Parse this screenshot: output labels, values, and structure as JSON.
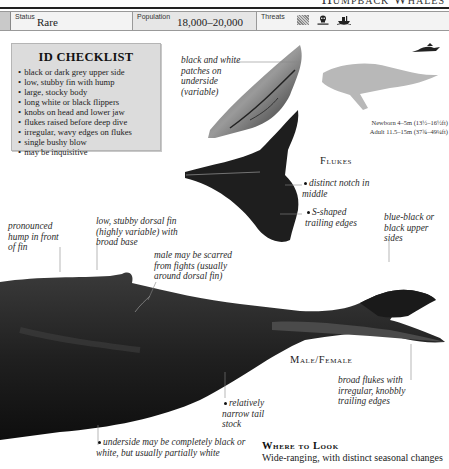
{
  "page_header": {
    "title": "Humpback Whales"
  },
  "facts": {
    "status_label": "Status",
    "status_value": "Rare",
    "population_label": "Population",
    "population_value": "18,000–20,000",
    "threats_label": "Threats",
    "threat_icons": [
      "net-icon",
      "pollution-skull-icon",
      "whaling-ship-icon"
    ]
  },
  "checklist": {
    "title": "ID CHECKLIST",
    "items": [
      "black or dark grey upper side",
      "low, stubby fin with hump",
      "large, stocky body",
      "long white or black flippers",
      "knobs on head and lower jaw",
      "flukes raised before deep dive",
      "irregular, wavy edges on flukes",
      "single bushy blow",
      "may be inquisitive"
    ]
  },
  "flukes_section": {
    "caption": "Flukes",
    "notes": {
      "underside": "black and white patches on underside (variable)",
      "notch": "distinct notch in middle",
      "trailing": "S-shaped trailing edges"
    }
  },
  "size": {
    "newborn": "Newborn 4–5m (13½–16½ft)",
    "adult": "Adult 11.5–15m (37¾–49¼ft)"
  },
  "body_notes": {
    "hump": "pronounced hump in front of fin",
    "dorsal": "low, stubby dorsal fin (highly variable) with broad base",
    "scars": "male may be scarred from fights (usually around dorsal fin)",
    "upper": "blue-black or black upper sides",
    "tail_stock": "relatively narrow tail stock",
    "underside": "underside may be completely black or white, but usually partially white",
    "broad_flukes": "broad flukes with irregular, knobbly trailing edges"
  },
  "male_female_caption": "Male/Female",
  "where_to_look": {
    "title": "Where to Look",
    "text": "Wide-ranging, with distinct seasonal changes"
  },
  "colors": {
    "whale_dark": "#1c1c1c",
    "silhouette_grey": "#b5b5b5",
    "checklist_bg": "#dcdcdc"
  }
}
